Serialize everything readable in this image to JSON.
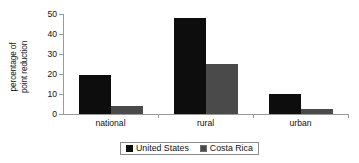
{
  "chart_data": {
    "type": "bar",
    "title": "",
    "xlabel": "",
    "ylabel_line1": "percentage of",
    "ylabel_line2": "point reduction",
    "categories": [
      "national",
      "rural",
      "urban"
    ],
    "series": [
      {
        "name": "United States",
        "values": [
          19.5,
          48,
          10
        ],
        "color": "#0d0d0d"
      },
      {
        "name": "Costa Rica",
        "values": [
          4,
          25,
          2.5
        ],
        "color": "#4a4a4a"
      }
    ],
    "ylim": [
      0,
      50
    ],
    "yticks": [
      0,
      10,
      20,
      30,
      40,
      50
    ],
    "ytick_labels": [
      "0",
      "10",
      "20",
      "30",
      "40",
      "50"
    ],
    "grid": false,
    "legend_position": "bottom"
  },
  "legend": {
    "items": [
      {
        "label": "United States",
        "swatch": "black-square-icon"
      },
      {
        "label": "Costa Rica",
        "swatch": "gray-square-icon"
      }
    ]
  }
}
